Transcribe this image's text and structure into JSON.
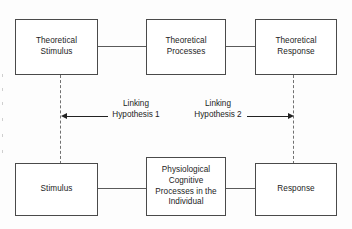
{
  "diagram": {
    "type": "flow-diagram",
    "boxes": {
      "theoretical_stimulus": "Theoretical\nStimulus",
      "theoretical_processes": "Theoretical\nProcesses",
      "theoretical_response": "Theoretical\nResponse",
      "stimulus": "Stimulus",
      "physiological": "Physiological\nCognitive\nProcesses in the\nIndividual",
      "response": "Response"
    },
    "labels": {
      "linking_hypothesis_1": "Linking\nHypothesis 1",
      "linking_hypothesis_2": "Linking\nHypothesis 2"
    },
    "colors": {
      "box_border": "#4a4a4a",
      "connector": "#5a5a5a",
      "dashed_link": "#707070",
      "arrow": "#222222",
      "text": "#1c1c1c",
      "background": "#fdfdfd"
    }
  }
}
